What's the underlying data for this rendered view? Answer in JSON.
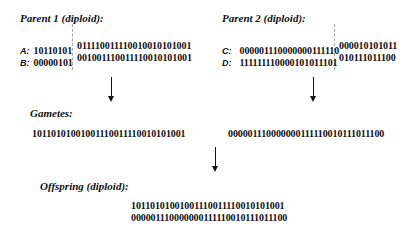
{
  "parent1": {
    "title": "Parent 1 (diploid):",
    "rows": [
      {
        "label": "A:",
        "left": "10110101",
        "right": "011110011110010010101001"
      },
      {
        "label": "B:",
        "left": "00000101",
        "right": "001001110011110010101001"
      }
    ]
  },
  "parent2": {
    "title": "Parent 2 (diploid):",
    "rows": [
      {
        "label": "C:",
        "left": "000001110000000111110",
        "right": "000010101011"
      },
      {
        "label": "D:",
        "left": "111111110000101011101",
        "right": "010111011100"
      }
    ]
  },
  "gametes": {
    "title": "Gametes:",
    "g1": "10110101001001110011110010101001",
    "g2": "000001110000000111110010111011100"
  },
  "offspring": {
    "title": "Offspring (diploid):",
    "chrom1": "10110101001001110011110010101001",
    "chrom2": "000001110000000111110010111011100"
  }
}
